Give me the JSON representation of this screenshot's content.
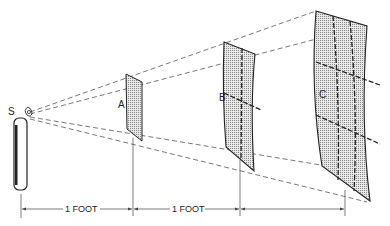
{
  "diagram": {
    "source": {
      "label": "S"
    },
    "surfaces": [
      {
        "label": "A",
        "grid": "1x1"
      },
      {
        "label": "B",
        "grid": "2x2"
      },
      {
        "label": "C",
        "grid": "3x3"
      }
    ],
    "dimensions": [
      {
        "label": "1 FOOT"
      },
      {
        "label": "1 FOOT"
      }
    ]
  }
}
